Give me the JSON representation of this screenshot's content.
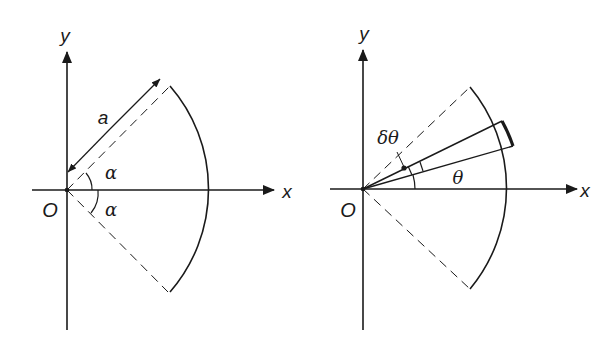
{
  "figures": [
    {
      "id": "left",
      "labels": {
        "y_axis": "y",
        "x_axis": "x",
        "origin": "O",
        "radius": "a",
        "angle_upper": "α",
        "angle_lower": "α"
      },
      "description": "Circular sector of radius a, half-angle α, symmetric about the x-axis"
    },
    {
      "id": "right",
      "labels": {
        "y_axis": "y",
        "x_axis": "x",
        "origin": "O",
        "element_angle": "δθ",
        "angle": "θ"
      },
      "description": "Same sector with an elemental slice of angle δθ at angle θ from the x-axis"
    }
  ],
  "colors": {
    "ink": "#1a1a1a",
    "background": "#ffffff"
  }
}
